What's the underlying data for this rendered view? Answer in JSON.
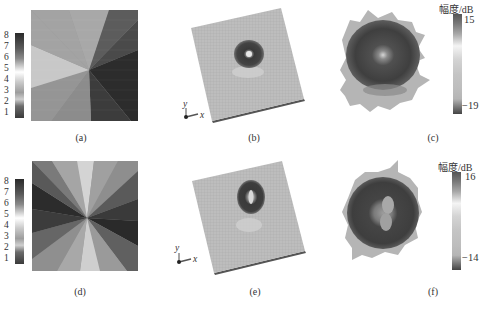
{
  "figure": {
    "panels": [
      {
        "id": "a",
        "caption": "(a)",
        "type": "phase-distribution",
        "pattern": "single-vortex (l=1)",
        "colorbar": {
          "ticks": [
            "8",
            "7",
            "6",
            "5",
            "4",
            "3",
            "2",
            "1"
          ]
        }
      },
      {
        "id": "b",
        "caption": "(b)",
        "type": "3d-metasurface-radiation",
        "axes": {
          "x": "x",
          "y": "y"
        }
      },
      {
        "id": "c",
        "caption": "(c)",
        "type": "far-field-amplitude",
        "colorbar": {
          "title": "幅度/dB",
          "max": "15",
          "min": "−19"
        }
      },
      {
        "id": "d",
        "caption": "(d)",
        "type": "phase-distribution",
        "pattern": "double-vortex (l=2)",
        "colorbar": {
          "ticks": [
            "8",
            "7",
            "6",
            "5",
            "4",
            "3",
            "2",
            "1"
          ]
        }
      },
      {
        "id": "e",
        "caption": "(e)",
        "type": "3d-metasurface-radiation",
        "axes": {
          "x": "x",
          "y": "y"
        }
      },
      {
        "id": "f",
        "caption": "(f)",
        "type": "far-field-amplitude",
        "colorbar": {
          "title": "幅度/dB",
          "max": "16",
          "min": "−14"
        }
      }
    ]
  },
  "colors": {
    "plate": "#b8b8b8",
    "plate_edge": "#6a6a6a",
    "beam_dark": "#3b3b3b",
    "beam_mid": "#8e8e8e",
    "beam_light": "#c8c8c8"
  }
}
